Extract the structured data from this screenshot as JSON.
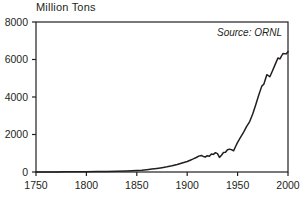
{
  "chart_data": {
    "type": "line",
    "title": "Million Tons",
    "xlabel": "",
    "ylabel": "Million Tons",
    "source_note": "Source: ORNL",
    "grid": false,
    "legend": "none",
    "xlim": [
      1750,
      2000
    ],
    "ylim": [
      0,
      8000
    ],
    "xticks": [
      1750,
      1800,
      1850,
      1900,
      1950,
      2000
    ],
    "xtick_labels": [
      "1750",
      "1800",
      "1850",
      "1900",
      "1950",
      "2000"
    ],
    "yticks": [
      0,
      2000,
      4000,
      6000,
      8000
    ],
    "ytick_labels": [
      "0",
      "2000",
      "4000",
      "6000",
      "8000"
    ],
    "line_color": "#231f20",
    "series": [
      {
        "name": "Global carbon emissions",
        "x": [
          1750,
          1760,
          1770,
          1780,
          1790,
          1800,
          1810,
          1820,
          1830,
          1840,
          1850,
          1855,
          1860,
          1865,
          1870,
          1875,
          1880,
          1885,
          1890,
          1895,
          1900,
          1903,
          1906,
          1909,
          1912,
          1914,
          1916,
          1918,
          1920,
          1922,
          1924,
          1926,
          1928,
          1930,
          1932,
          1934,
          1936,
          1938,
          1940,
          1942,
          1944,
          1946,
          1948,
          1950,
          1953,
          1956,
          1959,
          1962,
          1965,
          1968,
          1971,
          1974,
          1976,
          1979,
          1982,
          1984,
          1987,
          1990,
          1992,
          1995,
          1998,
          2000
        ],
        "y": [
          3,
          4,
          6,
          8,
          12,
          16,
          22,
          30,
          40,
          58,
          82,
          100,
          125,
          155,
          190,
          230,
          275,
          330,
          400,
          480,
          560,
          630,
          700,
          775,
          860,
          880,
          830,
          800,
          870,
          840,
          960,
          940,
          1030,
          980,
          780,
          890,
          1040,
          1050,
          1190,
          1220,
          1190,
          1130,
          1360,
          1580,
          1860,
          2130,
          2430,
          2690,
          3090,
          3590,
          4110,
          4580,
          4680,
          5190,
          5080,
          5320,
          5700,
          6080,
          6030,
          6320,
          6300,
          6420
        ]
      }
    ]
  }
}
